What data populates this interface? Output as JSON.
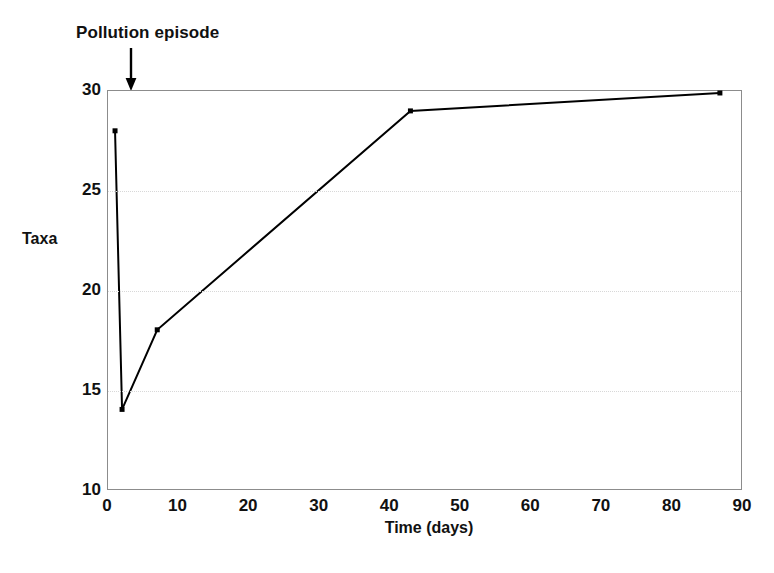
{
  "chart_data": {
    "type": "line",
    "title": "",
    "xlabel": "Time (days)",
    "ylabel": "Taxa",
    "xlim": [
      0,
      90
    ],
    "ylim": [
      10,
      30
    ],
    "xticks": [
      0,
      10,
      20,
      30,
      40,
      50,
      60,
      70,
      80,
      90
    ],
    "yticks": [
      10,
      15,
      20,
      25,
      30
    ],
    "grid": "horizontal-dotted",
    "legend": "none",
    "markers": "square",
    "line_color": "#000000",
    "grid_color": "#d8d8d8",
    "frame_color": "#8c8c8c",
    "x": [
      1,
      2,
      7,
      43,
      87
    ],
    "values": [
      28,
      14,
      18,
      29,
      29.9
    ],
    "series": [
      {
        "name": "Taxa",
        "x": [
          1,
          2,
          7,
          43,
          87
        ],
        "values": [
          28,
          14,
          18,
          29,
          29.9
        ]
      }
    ],
    "annotations": [
      {
        "text": "Pollution episode",
        "x": 2,
        "y": 30,
        "arrow": "down"
      }
    ]
  },
  "axes": {
    "y_tick_labels": [
      "30",
      "25",
      "20",
      "15",
      "10"
    ],
    "x_tick_labels": [
      "0",
      "10",
      "20",
      "30",
      "40",
      "50",
      "60",
      "70",
      "80",
      "90"
    ],
    "y_title": "Taxa",
    "x_title": "Time (days)"
  },
  "annotation": {
    "label": "Pollution episode"
  }
}
